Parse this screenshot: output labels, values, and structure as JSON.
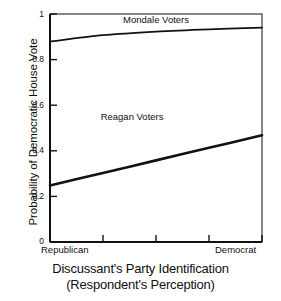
{
  "chart_data": {
    "type": "line",
    "title": "",
    "xlabel": "Discussant's Party Identification",
    "xlabel_line2": "(Respondent's Perception)",
    "ylabel": "Probability of Democratic House Vote",
    "ylim": [
      0,
      1
    ],
    "xlim": [
      0,
      4
    ],
    "grid": false,
    "legend_position": "inline-annotation",
    "yticks": [
      "0",
      "0.2",
      "0.4",
      "0.6",
      "0.8",
      "1"
    ],
    "ytick_values": [
      0,
      0.2,
      0.4,
      0.6,
      0.8,
      1
    ],
    "xtick_values": [
      0,
      1,
      2,
      3,
      4
    ],
    "xtick_labels": [
      "Republican",
      "",
      "",
      "",
      "Democrat"
    ],
    "x_axis_endpoints": {
      "left": "Republican",
      "right": "Democrat"
    },
    "series": [
      {
        "name": "Mondale Voters",
        "x": [
          0,
          1,
          2,
          3,
          4
        ],
        "values": [
          0.879,
          0.907,
          0.923,
          0.933,
          0.94
        ]
      },
      {
        "name": "Reagan Voters",
        "x": [
          0,
          1,
          2,
          3,
          4
        ],
        "values": [
          0.248,
          0.303,
          0.358,
          0.413,
          0.468
        ]
      }
    ],
    "annotations": [
      {
        "text": "Mondale Voters",
        "x": 2.0,
        "y": 0.975
      },
      {
        "text": "Reagan Voters",
        "x": 1.55,
        "y": 0.55
      }
    ],
    "colors": {
      "axis": "#111111",
      "mondale_line": "#111111",
      "reagan_line": "#111111",
      "background": "#ffffff"
    }
  }
}
